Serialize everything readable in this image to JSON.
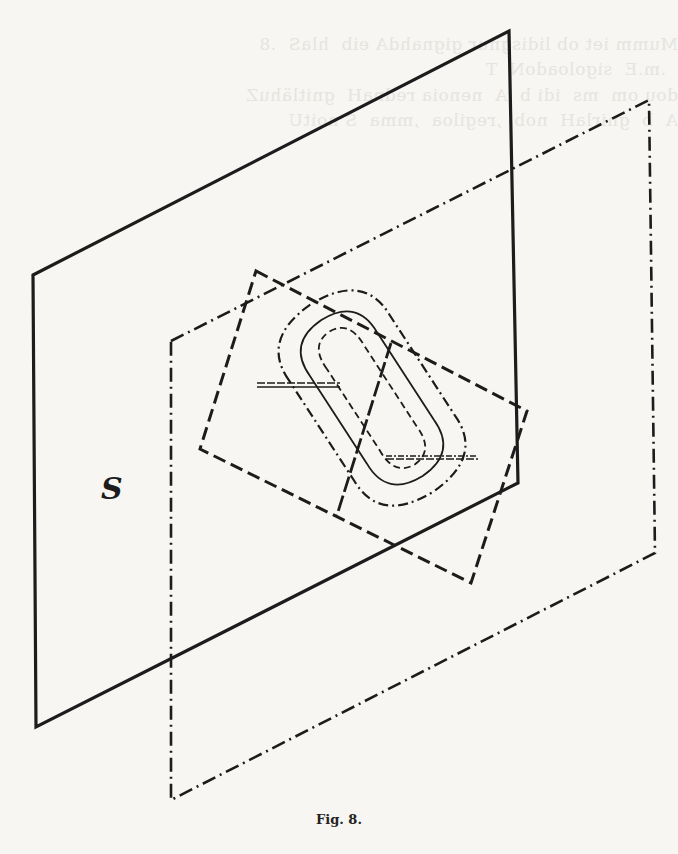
{
  "figure": {
    "caption": "Fig. 8.",
    "plane_label": "S",
    "colors": {
      "ink": "#1c1c1c",
      "paper": "#f7f6f3",
      "bleed": "#e6e4df"
    },
    "elements": [
      {
        "name": "plane-S",
        "style": "solid",
        "points": [
          [
            33,
            275
          ],
          [
            509,
            31
          ],
          [
            518,
            483
          ],
          [
            36,
            727
          ]
        ]
      },
      {
        "name": "plane-dashdot",
        "style": "dash-dot",
        "points": [
          [
            171,
            341
          ],
          [
            649,
            100
          ],
          [
            655,
            553
          ],
          [
            171,
            800
          ]
        ]
      },
      {
        "name": "tilted-square",
        "style": "dashed",
        "points": [
          [
            256,
            271
          ],
          [
            527,
            411
          ],
          [
            471,
            583
          ],
          [
            200,
            449
          ]
        ]
      },
      {
        "name": "intersection-line",
        "style": "dashed-heavy",
        "points": [
          [
            391,
            343
          ],
          [
            337,
            515
          ]
        ]
      },
      {
        "name": "outer-contour",
        "style": "dash-dot"
      },
      {
        "name": "middle-contour",
        "style": "solid-thin"
      },
      {
        "name": "inner-contour",
        "style": "dashed-thin"
      },
      {
        "name": "upper-tick",
        "style": "double-line"
      },
      {
        "name": "lower-tick",
        "style": "double-line"
      }
    ]
  },
  "bleed_through_text": [
    "Mumm iet ob lidisgnur gignahdA eib  hlaS  .8",
    "  .m.E  sigoloadoN  T",
    "dou om  ms  idi b  A  nenoia rednaH  gnitlähuZ",
    "A  b  gnirlaH  nob  ,regiloa  ,mma  S noitU"
  ]
}
